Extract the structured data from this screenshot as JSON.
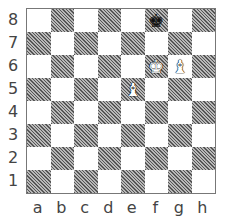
{
  "board": {
    "files": [
      "a",
      "b",
      "c",
      "d",
      "e",
      "f",
      "g",
      "h"
    ],
    "ranks": [
      "8",
      "7",
      "6",
      "5",
      "4",
      "3",
      "2",
      "1"
    ],
    "light_color": "#ffffff",
    "dark_style": "hatched",
    "pieces": [
      {
        "square": "f8",
        "type": "king",
        "color": "black",
        "glyph": "♚"
      },
      {
        "square": "f6",
        "type": "king",
        "color": "white",
        "glyph": "♚"
      },
      {
        "square": "g6",
        "type": "bishop",
        "color": "white",
        "glyph": "♝"
      },
      {
        "square": "e5",
        "type": "bishop",
        "color": "white",
        "glyph": "♝"
      }
    ]
  }
}
